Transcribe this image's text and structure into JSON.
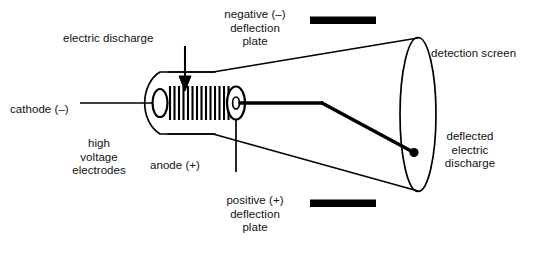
{
  "diagram": {
    "background_color": "#ffffff",
    "stroke_color": "#000000",
    "labels": {
      "electric_discharge": "electric discharge",
      "negative_plate": "negative (–)\ndeflection\nplate",
      "detection_screen": "detection screen",
      "cathode": "cathode (–)",
      "high_voltage_electrodes": "high\nvoltage\nelectrodes",
      "anode": "anode (+)",
      "positive_plate": "positive (+)\ndeflection\nplate",
      "deflected_discharge": "deflected\nelectric\ndischarge"
    },
    "parts": [
      {
        "name": "cathode-electrode",
        "charge": "–",
        "label": "cathode (–)"
      },
      {
        "name": "anode-electrode",
        "charge": "+",
        "label": "anode (+)"
      },
      {
        "name": "negative-deflection-plate",
        "charge": "–",
        "label": "negative (–) deflection plate"
      },
      {
        "name": "positive-deflection-plate",
        "charge": "+",
        "label": "positive (+) deflection plate"
      },
      {
        "name": "detection-screen",
        "charge": "",
        "label": "detection screen"
      },
      {
        "name": "electron-beam",
        "charge": "",
        "label": "electric discharge"
      },
      {
        "name": "deflected-beam",
        "charge": "",
        "label": "deflected electric discharge"
      }
    ]
  }
}
